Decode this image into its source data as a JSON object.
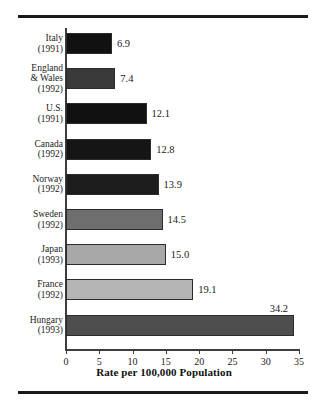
{
  "chart_data": {
    "type": "bar",
    "orientation": "horizontal",
    "title": "",
    "xlabel": "Rate per 100,000 Population",
    "ylabel": "",
    "xlim": [
      0,
      35
    ],
    "xticks": [
      "0",
      "5",
      "10",
      "15",
      "20",
      "25",
      "30",
      "35"
    ],
    "grid": false,
    "legend": "none",
    "categories": [
      "Italy\n(1991)",
      "England\n& Wales\n(1992)",
      "U.S.\n(1991)",
      "Canada\n(1992)",
      "Norway\n(1992)",
      "Sweden\n(1992)",
      "Japan\n(1993)",
      "France\n(1992)",
      "Hungary\n(1993)"
    ],
    "values": [
      6.9,
      7.4,
      12.1,
      12.8,
      13.9,
      14.5,
      15.0,
      19.1,
      34.2
    ],
    "value_labels": [
      "6.9",
      "7.4",
      "12.1",
      "12.8",
      "13.9",
      "14.5",
      "15.0",
      "19.1",
      "34.2"
    ],
    "bar_colors": [
      "#111111",
      "#3a3a3a",
      "#111111",
      "#151515",
      "#1d1d1d",
      "#6e6e6e",
      "#a8a8a8",
      "#b4b4b4",
      "#4e4e4e"
    ],
    "bars": [
      {
        "country": "Italy",
        "year": "(1991)",
        "label": "Italy\n(1991)",
        "value": 6.9,
        "value_label": "6.9",
        "color": "#111111",
        "label_position": "right"
      },
      {
        "country": "England & Wales",
        "year": "(1992)",
        "label": "England\n& Wales\n(1992)",
        "value": 7.4,
        "value_label": "7.4",
        "color": "#3a3a3a",
        "label_position": "right"
      },
      {
        "country": "U.S.",
        "year": "(1991)",
        "label": "U.S.\n(1991)",
        "value": 12.1,
        "value_label": "12.1",
        "color": "#111111",
        "label_position": "right"
      },
      {
        "country": "Canada",
        "year": "(1992)",
        "label": "Canada\n(1992)",
        "value": 12.8,
        "value_label": "12.8",
        "color": "#151515",
        "label_position": "right"
      },
      {
        "country": "Norway",
        "year": "(1992)",
        "label": "Norway\n(1992)",
        "value": 13.9,
        "value_label": "13.9",
        "color": "#1d1d1d",
        "label_position": "right"
      },
      {
        "country": "Sweden",
        "year": "(1992)",
        "label": "Sweden\n(1992)",
        "value": 14.5,
        "value_label": "14.5",
        "color": "#6e6e6e",
        "label_position": "right"
      },
      {
        "country": "Japan",
        "year": "(1993)",
        "label": "Japan\n(1993)",
        "value": 15.0,
        "value_label": "15.0",
        "color": "#a8a8a8",
        "label_position": "right"
      },
      {
        "country": "France",
        "year": "(1992)",
        "label": "France\n(1992)",
        "value": 19.1,
        "value_label": "19.1",
        "color": "#b4b4b4",
        "label_position": "right"
      },
      {
        "country": "Hungary",
        "year": "(1993)",
        "label": "Hungary\n(1993)",
        "value": 34.2,
        "value_label": "34.2",
        "color": "#4e4e4e",
        "label_position": "above"
      }
    ]
  },
  "figure": {
    "axis_color": "#3d3d3d",
    "rule_color": "#1a1a1a",
    "background": "#ffffff"
  }
}
